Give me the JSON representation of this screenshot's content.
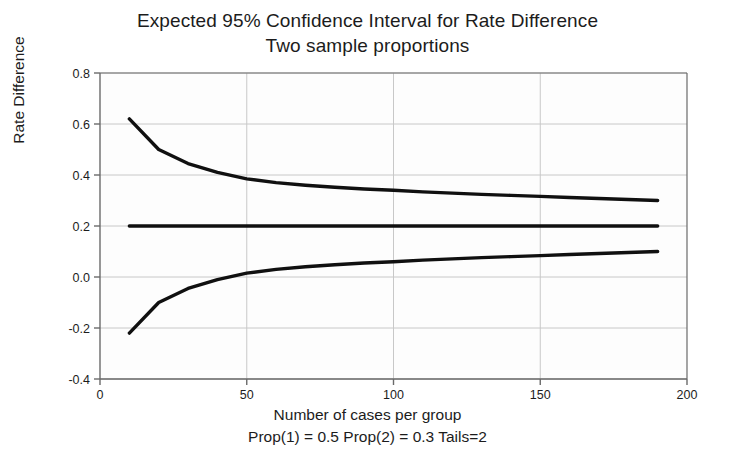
{
  "chart_data": {
    "type": "line",
    "title": "Expected 95% Confidence Interval for Rate Difference",
    "subtitle": "Two sample proportions",
    "xlabel": "Number of cases per group",
    "caption": "Prop(1) = 0.5 Prop(2) = 0.3 Tails=2",
    "ylabel": "Rate Difference",
    "xlim": [
      0,
      200
    ],
    "ylim": [
      -0.4,
      0.8
    ],
    "xticks": [
      0,
      50,
      100,
      150,
      200
    ],
    "xtick_labels": [
      "0",
      "50",
      "100",
      "150",
      "200"
    ],
    "yticks": [
      -0.4,
      -0.2,
      0.0,
      0.2,
      0.4,
      0.6,
      0.8
    ],
    "ytick_labels": [
      "-0.4",
      "-0.2",
      "0.0",
      "0.2",
      "0.4",
      "0.6",
      "0.8"
    ],
    "grid": true,
    "grid_color": "#c8c8c8",
    "axis_color": "#6a6a6a",
    "line_color": "#101010",
    "background": "#fdfdfd",
    "legend": "none",
    "x": [
      10,
      20,
      30,
      40,
      50,
      60,
      70,
      80,
      90,
      100,
      110,
      120,
      130,
      140,
      150,
      160,
      170,
      180,
      190
    ],
    "series": [
      {
        "name": "Upper 95% confidence limit",
        "values": [
          0.62,
          0.5,
          0.445,
          0.41,
          0.385,
          0.37,
          0.36,
          0.352,
          0.345,
          0.34,
          0.334,
          0.329,
          0.324,
          0.32,
          0.316,
          0.312,
          0.308,
          0.304,
          0.3
        ]
      },
      {
        "name": "Expected rate difference",
        "values": [
          0.2,
          0.2,
          0.2,
          0.2,
          0.2,
          0.2,
          0.2,
          0.2,
          0.2,
          0.2,
          0.2,
          0.2,
          0.2,
          0.2,
          0.2,
          0.2,
          0.2,
          0.2,
          0.2
        ]
      },
      {
        "name": "Lower 95% confidence limit",
        "values": [
          -0.22,
          -0.1,
          -0.045,
          -0.01,
          0.015,
          0.03,
          0.04,
          0.048,
          0.055,
          0.06,
          0.066,
          0.071,
          0.076,
          0.08,
          0.084,
          0.088,
          0.092,
          0.096,
          0.1
        ]
      }
    ]
  }
}
